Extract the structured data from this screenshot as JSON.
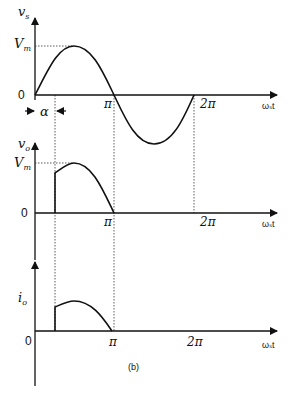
{
  "figure": {
    "caption": "(b)",
    "x_axis_label": "ωₛt",
    "alpha_label": "α"
  },
  "plots": [
    {
      "id": "source-voltage",
      "y_label": "v",
      "y_sub": "s",
      "peak_label": "V",
      "peak_sub": "m",
      "origin_label": "0",
      "ticks": [
        "π",
        "2π"
      ]
    },
    {
      "id": "output-voltage",
      "y_label": "v",
      "y_sub": "o",
      "peak_label": "V",
      "peak_sub": "m",
      "origin_label": "0",
      "ticks": [
        "π",
        "2π"
      ]
    },
    {
      "id": "output-current",
      "y_label": "i",
      "y_sub": "o",
      "origin_label": "0",
      "ticks": [
        "π",
        "2π"
      ]
    }
  ]
}
